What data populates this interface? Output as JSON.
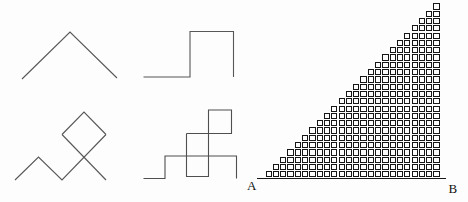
{
  "canvas": {
    "width": 468,
    "height": 202,
    "background": "#fdfdfd"
  },
  "style": {
    "thin_stroke": "#575757",
    "grid_stroke": "#161616",
    "label_color": "#111111"
  },
  "figures": {
    "chevron_path": {
      "desc": "single peak zigzag path",
      "stroke": "#575757",
      "stroke_width": 1.1,
      "polylines": [
        [
          [
            22,
            79
          ],
          [
            70,
            32
          ],
          [
            117,
            78
          ]
        ]
      ]
    },
    "square_step_path": {
      "desc": "single square step path",
      "stroke": "#575757",
      "stroke_width": 1.1,
      "polylines": [
        [
          [
            143.5,
            77
          ],
          [
            190,
            77
          ],
          [
            190,
            31.5
          ],
          [
            233.5,
            31.5
          ],
          [
            233.5,
            77
          ]
        ]
      ]
    },
    "diamond_zigzag_path": {
      "desc": "zigzag path crossing through a rotated square (diamond)",
      "stroke": "#575757",
      "stroke_width": 1.1,
      "polylines": [
        [
          [
            15,
            180
          ],
          [
            38.5,
            157
          ],
          [
            62,
            180
          ],
          [
            106,
            134.5
          ]
        ],
        [
          [
            62,
            134.5
          ],
          [
            84,
            112
          ],
          [
            106,
            134.5
          ]
        ],
        [
          [
            62,
            134.5
          ],
          [
            106,
            180
          ]
        ]
      ]
    },
    "stacked_squares_path": {
      "desc": "step path with overlapping squares",
      "stroke": "#4f4f4f",
      "stroke_width": 1.1,
      "polylines": [
        [
          [
            143.5,
            178.5
          ],
          [
            165,
            178.5
          ],
          [
            165,
            156
          ],
          [
            236.5,
            156
          ],
          [
            236.5,
            178.5
          ]
        ],
        [
          [
            186.5,
            133.5
          ],
          [
            186.5,
            176.5
          ],
          [
            208.5,
            176.5
          ],
          [
            208.5,
            110
          ],
          [
            231.5,
            110
          ],
          [
            231.5,
            133.5
          ],
          [
            186.5,
            133.5
          ]
        ]
      ]
    }
  },
  "staircase_triangle": {
    "desc": "right triangle from A to B filled with a staircase grid of small squares",
    "label_a": "A",
    "label_b": "B",
    "grid": {
      "rows": 24,
      "cols": 24,
      "pitch": 7.3,
      "square_size": 6.3,
      "border_width": 1.1,
      "origin_x": 265.5,
      "baseline_y": 178.5
    },
    "baseline": {
      "x1": 257,
      "x2": 446,
      "y": 177.6,
      "thickness": 1.3
    }
  }
}
